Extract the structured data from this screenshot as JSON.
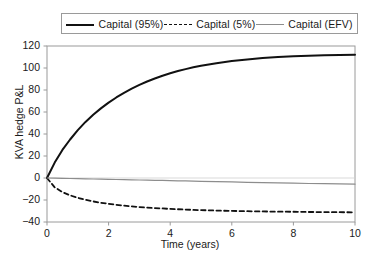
{
  "chart_data": {
    "type": "line",
    "title": "",
    "xlabel": "Time (years)",
    "ylabel": "KVA hedge P&L",
    "xlim": [
      0,
      10
    ],
    "ylim": [
      -40,
      120
    ],
    "xticks": [
      0,
      2,
      4,
      6,
      8,
      10
    ],
    "yticks": [
      -40,
      -20,
      0,
      20,
      40,
      60,
      80,
      100,
      120
    ],
    "xticklabels": [
      "0",
      "2",
      "4",
      "6",
      "8",
      "10"
    ],
    "yticklabels": [
      "120",
      "100",
      "80",
      "60",
      "40",
      "20",
      "0",
      "−20",
      "−40"
    ],
    "grid": false,
    "legend_position": "upper-center-outside",
    "x": [
      0,
      0.25,
      0.5,
      0.75,
      1,
      1.25,
      1.5,
      1.75,
      2,
      2.25,
      2.5,
      2.75,
      3,
      3.25,
      3.5,
      3.75,
      4,
      4.25,
      4.5,
      4.75,
      5,
      5.5,
      6,
      6.5,
      7,
      7.5,
      8,
      8.5,
      9,
      9.5,
      10
    ],
    "series": [
      {
        "name": "Capital (95%)",
        "style": "solid",
        "color": "#111111",
        "width": 2.0,
        "values": [
          0,
          14.0,
          25.5,
          35.0,
          43.5,
          51.0,
          57.5,
          63.3,
          68.5,
          73.2,
          77.4,
          81.2,
          84.6,
          87.7,
          90.5,
          93.0,
          95.2,
          97.2,
          99.0,
          100.6,
          102.0,
          104.4,
          106.3,
          107.8,
          109.0,
          109.9,
          110.6,
          111.1,
          111.5,
          111.8,
          112.0
        ]
      },
      {
        "name": "Capital (5%)",
        "style": "dashed",
        "color": "#111111",
        "width": 1.8,
        "values": [
          0,
          -8.5,
          -12.8,
          -15.8,
          -18.0,
          -19.8,
          -21.3,
          -22.5,
          -23.5,
          -24.4,
          -25.1,
          -25.8,
          -26.4,
          -26.9,
          -27.3,
          -27.7,
          -28.1,
          -28.4,
          -28.7,
          -29.0,
          -29.2,
          -29.6,
          -29.9,
          -30.2,
          -30.4,
          -30.6,
          -30.7,
          -30.9,
          -31.0,
          -31.1,
          -31.2
        ]
      },
      {
        "name": "Capital (EFV)",
        "style": "solid",
        "color": "#8d8d8d",
        "width": 1.2,
        "values": [
          0,
          -0.15,
          -0.3,
          -0.45,
          -0.6,
          -0.75,
          -0.9,
          -1.05,
          -1.2,
          -1.35,
          -1.5,
          -1.65,
          -1.8,
          -1.95,
          -2.1,
          -2.25,
          -2.4,
          -2.55,
          -2.7,
          -2.85,
          -3.0,
          -3.3,
          -3.6,
          -3.9,
          -4.2,
          -4.5,
          -4.75,
          -5.0,
          -5.2,
          -5.4,
          -5.6
        ]
      }
    ]
  },
  "legend": {
    "entries": [
      {
        "label": "Capital (95%)",
        "swatch": "solid-dark-line-icon"
      },
      {
        "label": "Capital (5%)",
        "swatch": "dashed-dark-line-icon"
      },
      {
        "label": "Capital (EFV)",
        "swatch": "solid-grey-line-icon"
      }
    ]
  },
  "axes": {
    "x_title": "Time (years)",
    "y_title": "KVA hedge P&L"
  },
  "colors": {
    "series_95": "#111111",
    "series_5": "#111111",
    "series_efv": "#8d8d8d",
    "axis": "#9a9a9a",
    "text": "#1a1a1a",
    "background": "#ffffff"
  }
}
